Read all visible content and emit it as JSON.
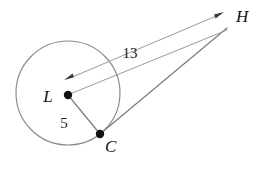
{
  "figure": {
    "background_color": "#ffffff",
    "stroke_color": "#8a8a8a",
    "label_color": "#111111",
    "width": 268,
    "height": 172
  },
  "labels": {
    "center_point": "L",
    "tangent_point": "C",
    "external_point": "H",
    "radius_measure": "5",
    "hypotenuse_measure": "13"
  },
  "geometry": {
    "circle": {
      "cx": 68,
      "cy": 93,
      "r": 52
    },
    "points": {
      "L": {
        "x": 68,
        "y": 95
      },
      "C": {
        "x": 100,
        "y": 134
      },
      "H": {
        "x": 228,
        "y": 27
      }
    },
    "segments": [
      {
        "name": "L-to-C-radius",
        "from": "L",
        "to": "C",
        "measure": "5"
      },
      {
        "name": "C-to-H-tangent",
        "from": "C",
        "to": "H"
      },
      {
        "name": "H-to-L-ray",
        "from": "H",
        "to": "L",
        "measure": "13",
        "arrow": "both"
      }
    ]
  },
  "label_positions": {
    "L": {
      "x": 48,
      "y": 102
    },
    "C": {
      "x": 105,
      "y": 152
    },
    "H": {
      "x": 236,
      "y": 22
    },
    "radius_measure": {
      "x": 64,
      "y": 128
    },
    "hypotenuse_measure": {
      "x": 130,
      "y": 58
    }
  }
}
